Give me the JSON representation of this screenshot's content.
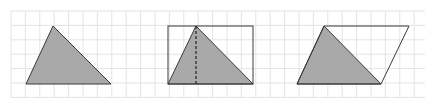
{
  "diagram": {
    "colors": {
      "background": "#ffffff",
      "grid": "#e4e4e4",
      "fill": "#a9a9a9",
      "stroke": "#3a3a3a"
    },
    "grid": {
      "x0": 11,
      "y0": 11,
      "x1": 425,
      "y1": 98,
      "step": 14.4
    },
    "figures": [
      {
        "name": "triangle",
        "triangle": [
          [
            26,
            84
          ],
          [
            53,
            26
          ],
          [
            111,
            84
          ]
        ]
      },
      {
        "name": "triangle-in-rectangle",
        "rectangle": {
          "x": 168,
          "y": 26,
          "w": 85,
          "h": 58
        },
        "triangle": [
          [
            168,
            84
          ],
          [
            196,
            26
          ],
          [
            253,
            84
          ]
        ],
        "height_line": [
          [
            196,
            26
          ],
          [
            196,
            84
          ]
        ]
      },
      {
        "name": "triangle-in-parallelogram",
        "parallelogram": [
          [
            297,
            84
          ],
          [
            324,
            26
          ],
          [
            409,
            26
          ],
          [
            381,
            84
          ]
        ],
        "triangle": [
          [
            297,
            84
          ],
          [
            324,
            26
          ],
          [
            381,
            84
          ]
        ]
      }
    ]
  }
}
